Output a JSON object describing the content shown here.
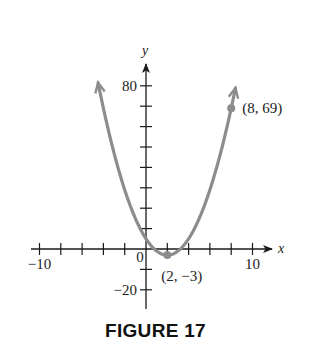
{
  "chart_data": {
    "type": "line",
    "title": "",
    "caption": "FIGURE 17",
    "function": "y = 2(x - 2)^2 - 3",
    "xlabel": "x",
    "ylabel": "y",
    "xlim": [
      -10,
      10
    ],
    "ylim": [
      -20,
      80
    ],
    "x_tick_step": 2,
    "y_tick_step": 10,
    "x_tick_labels": [
      {
        "value": -10,
        "label": "−10"
      },
      {
        "value": 0,
        "label": "0"
      },
      {
        "value": 10,
        "label": "10"
      }
    ],
    "y_tick_labels": [
      {
        "value": 80,
        "label": "80"
      },
      {
        "value": -20,
        "label": "−20"
      }
    ],
    "grid": false,
    "legend": null,
    "series": [
      {
        "name": "parabola",
        "color": "#8c8c8c",
        "x": [
          -4.5,
          -4,
          -3,
          -2,
          -1,
          0,
          1,
          2,
          3,
          4,
          5,
          6,
          7,
          8,
          8.4
        ],
        "values": [
          81.5,
          69,
          47,
          29,
          15,
          5,
          -1,
          -3,
          -1,
          5,
          15,
          29,
          47,
          69,
          78.9
        ]
      }
    ],
    "annotations": [
      {
        "x": 8,
        "y": 69,
        "label": "(8, 69)",
        "marker": true
      },
      {
        "x": 2,
        "y": -3,
        "label": "(2, −3)",
        "marker": true
      }
    ]
  },
  "colors": {
    "curve": "#8c8c8c",
    "axes": "#1a1a1a",
    "background": "#ffffff"
  }
}
